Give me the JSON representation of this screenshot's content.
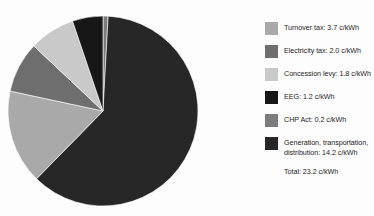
{
  "chart_data": {
    "type": "pie",
    "title": "",
    "subtitle": "",
    "unit": "c/kWh",
    "legend_position": "right",
    "grid": false,
    "categories": [
      "Turnover tax",
      "Electricity tax",
      "Concession levy",
      "EEG",
      "CHP Act",
      "Generation, transportation, distribution"
    ],
    "values": [
      3.7,
      2.0,
      1.8,
      1.2,
      0.2,
      14.2
    ],
    "colors": [
      "#a9a9a9",
      "#6e6e6e",
      "#c9c9c9",
      "#171717",
      "#7c7c7c",
      "#272727"
    ],
    "total_value": 23.2,
    "total_label": "Total: 23.2 c/kWh",
    "start_angle_deg": 0,
    "direction": "clockwise",
    "slices": [
      {
        "name": "CHP Act",
        "value": 0.2,
        "label": "CHP Act: 0.2 c/kWh",
        "color": "#7c7c7c",
        "percent": 0.9
      },
      {
        "name": "Generation, transportation, distribution",
        "value": 14.2,
        "label": "Generation, transportation,\ndistribution: 14.2 c/kWh",
        "color": "#272727",
        "percent": 61.2
      },
      {
        "name": "Turnover tax",
        "value": 3.7,
        "label": "Turnover tax: 3.7 c/kWh",
        "color": "#a9a9a9",
        "percent": 15.9
      },
      {
        "name": "Electricity tax",
        "value": 2.0,
        "label": "Electricity tax: 2.0 c/kWh",
        "color": "#6e6e6e",
        "percent": 8.6
      },
      {
        "name": "Concession levy",
        "value": 1.8,
        "label": "Concession levy: 1.8 c/kWh",
        "color": "#c9c9c9",
        "percent": 7.8
      },
      {
        "name": "EEG",
        "value": 1.2,
        "label": "EEG: 1.2 c/kWh",
        "color": "#171717",
        "percent": 5.2
      }
    ]
  },
  "legend": {
    "items": [
      {
        "label": "Turnover tax: 3.7 c/kWh",
        "color": "#a9a9a9",
        "name": "turnover-tax"
      },
      {
        "label": "Electricity tax: 2.0 c/kWh",
        "color": "#6e6e6e",
        "name": "electricity-tax"
      },
      {
        "label": "Concession levy: 1.8 c/kWh",
        "color": "#c9c9c9",
        "name": "concession-levy"
      },
      {
        "label": "EEG: 1.2 c/kWh",
        "color": "#171717",
        "name": "eeg"
      },
      {
        "label": "CHP Act: 0.2 c/kWh",
        "color": "#7c7c7c",
        "name": "chp-act"
      },
      {
        "label": "Generation, transportation,\ndistribution: 14.2 c/kWh",
        "color": "#272727",
        "name": "generation-transportation-distribution"
      }
    ],
    "total": "Total: 23.2 c/kWh"
  },
  "colors": {
    "background": "#fdfdfd",
    "text": "#1d1d1d",
    "slice_stroke": "#ffffff"
  }
}
